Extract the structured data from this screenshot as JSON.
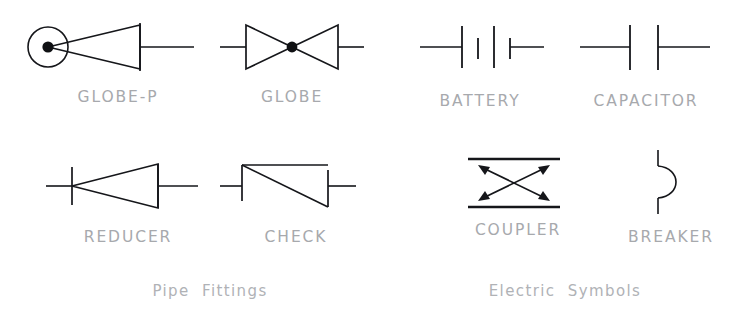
{
  "sheet": {
    "title": "Pipe Fittings and Electric Symbols",
    "stroke_color": "#15161a",
    "label_color": "#a7a9ad",
    "caption_color": "#b0b2b6",
    "background_color": "#ffffff"
  },
  "groups": [
    {
      "id": "pipe-fittings",
      "caption": "Pipe  Fittings",
      "symbols": [
        {
          "id": "globe-p",
          "label": "GLOBE-P",
          "icon": "globe-valve-with-positioner-icon"
        },
        {
          "id": "globe",
          "label": "GLOBE",
          "icon": "globe-valve-bowtie-icon"
        },
        {
          "id": "reducer",
          "label": "REDUCER",
          "icon": "reducer-icon"
        },
        {
          "id": "check",
          "label": "CHECK",
          "icon": "check-valve-icon"
        }
      ]
    },
    {
      "id": "electric-symbols",
      "caption": "Electric  Symbols",
      "symbols": [
        {
          "id": "battery",
          "label": "BATTERY",
          "icon": "battery-cell-icon"
        },
        {
          "id": "capacitor",
          "label": "CAPACITOR",
          "icon": "capacitor-icon"
        },
        {
          "id": "coupler",
          "label": "COUPLER",
          "icon": "coupler-crossed-arrows-icon"
        },
        {
          "id": "breaker",
          "label": "BREAKER",
          "icon": "breaker-half-loop-icon"
        }
      ]
    }
  ],
  "labels": {
    "globe_p": "GLOBE-P",
    "globe": "GLOBE",
    "battery": "BATTERY",
    "capacitor": "CAPACITOR",
    "reducer": "REDUCER",
    "check": "CHECK",
    "coupler": "COUPLER",
    "breaker": "BREAKER"
  },
  "captions": {
    "pipe_fittings": "Pipe  Fittings",
    "electric_symbols": "Electric  Symbols"
  }
}
